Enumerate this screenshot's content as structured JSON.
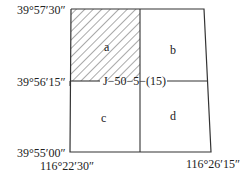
{
  "diagram": {
    "type": "map-sheet-subdivision",
    "sheet_label": "J−50−5−(15)",
    "latitudes": {
      "top": "39°57′30″",
      "middle": "39°56′15″",
      "bottom": "39°55′00″"
    },
    "longitudes": {
      "left": "116°22′30″",
      "right": "116°26′15″"
    },
    "cells": [
      {
        "id": "a",
        "label": "a",
        "position": "top-left",
        "hatched": true
      },
      {
        "id": "b",
        "label": "b",
        "position": "top-right",
        "hatched": false
      },
      {
        "id": "c",
        "label": "c",
        "position": "bottom-left",
        "hatched": false
      },
      {
        "id": "d",
        "label": "d",
        "position": "bottom-right",
        "hatched": false
      }
    ],
    "colors": {
      "line": "#333333",
      "hatch": "#555555",
      "background": "#ffffff"
    }
  }
}
